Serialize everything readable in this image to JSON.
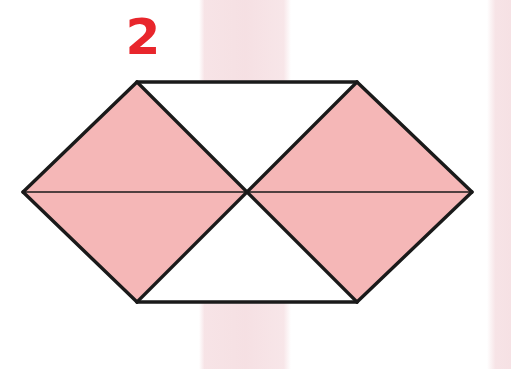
{
  "figure": {
    "label": "2",
    "label_color": "#e8262c",
    "shaded_color": "#f5b7b7",
    "unshaded_color": "#ffffff",
    "stroke_color": "#1a1a1a",
    "background_color": "#ffffff",
    "band_color": "#f0cdd2",
    "shape": "hexagon",
    "total_parts": 6,
    "shaded_parts": 4,
    "canvas": {
      "width": 511,
      "height": 369
    },
    "vertices": {
      "left": {
        "x": 23,
        "y": 192
      },
      "top_left": {
        "x": 137,
        "y": 82
      },
      "top_right": {
        "x": 357,
        "y": 82
      },
      "right": {
        "x": 472,
        "y": 192
      },
      "bottom_right": {
        "x": 357,
        "y": 302
      },
      "bottom_left": {
        "x": 137,
        "y": 302
      },
      "center": {
        "x": 247,
        "y": 192
      }
    },
    "regions": [
      {
        "name": "left-upper-triangle",
        "shaded": true,
        "points": "23,192 137,82 247,192"
      },
      {
        "name": "left-lower-triangle",
        "shaded": true,
        "points": "23,192 247,192 137,302"
      },
      {
        "name": "top-center-triangle",
        "shaded": false,
        "points": "137,82 357,82 247,192"
      },
      {
        "name": "bottom-center-triangle",
        "shaded": false,
        "points": "137,302 247,192 357,302"
      },
      {
        "name": "right-upper-triangle",
        "shaded": true,
        "points": "247,192 357,82 472,192"
      },
      {
        "name": "right-lower-triangle",
        "shaded": true,
        "points": "247,192 472,192 357,302"
      }
    ],
    "edges": [
      {
        "name": "top-edge",
        "x1": 137,
        "y1": 82,
        "x2": 357,
        "y2": 82
      },
      {
        "name": "upper-right-edge",
        "x1": 357,
        "y1": 82,
        "x2": 472,
        "y2": 192
      },
      {
        "name": "lower-right-edge",
        "x1": 472,
        "y1": 192,
        "x2": 357,
        "y2": 302
      },
      {
        "name": "bottom-edge",
        "x1": 357,
        "y1": 302,
        "x2": 137,
        "y2": 302
      },
      {
        "name": "lower-left-edge",
        "x1": 137,
        "y1": 302,
        "x2": 23,
        "y2": 192
      },
      {
        "name": "upper-left-edge",
        "x1": 23,
        "y1": 192,
        "x2": 137,
        "y2": 82
      }
    ],
    "interior_lines": [
      {
        "name": "horizontal-midline",
        "x1": 23,
        "y1": 192,
        "x2": 472,
        "y2": 192,
        "weight": "thin"
      },
      {
        "name": "diagonal-top-left-center",
        "x1": 137,
        "y1": 82,
        "x2": 247,
        "y2": 192,
        "weight": "thick"
      },
      {
        "name": "diagonal-top-right-center",
        "x1": 357,
        "y1": 82,
        "x2": 247,
        "y2": 192,
        "weight": "thick"
      },
      {
        "name": "diagonal-bottom-left-center",
        "x1": 137,
        "y1": 302,
        "x2": 247,
        "y2": 192,
        "weight": "thick"
      },
      {
        "name": "diagonal-bottom-right-center",
        "x1": 357,
        "y1": 302,
        "x2": 247,
        "y2": 192,
        "weight": "thick"
      }
    ],
    "scan_bands": [
      {
        "name": "center-band",
        "x": 199,
        "width": 92
      },
      {
        "name": "right-band",
        "x": 487,
        "width": 24
      }
    ]
  }
}
